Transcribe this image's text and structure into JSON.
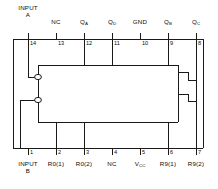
{
  "diagram": {
    "kind": "ic-pin-connection-diagram",
    "line_color": "#1a1a1a",
    "background": "#ffffff",
    "top_pins": [
      {
        "number": "14",
        "label": "INPUT",
        "label2": "A",
        "x": 28,
        "connects": true
      },
      {
        "number": "13",
        "label": "NC",
        "label2": "",
        "x": 56,
        "connects": false
      },
      {
        "number": "12",
        "label": "Q",
        "sub": "A",
        "label2": "",
        "x": 84,
        "connects": true
      },
      {
        "number": "11",
        "label": "Q",
        "sub": "D",
        "label2": "",
        "x": 112,
        "connects": true
      },
      {
        "number": "10",
        "label": "GND",
        "label2": "",
        "x": 140,
        "connects": false
      },
      {
        "number": "9",
        "label": "Q",
        "sub": "B",
        "label2": "",
        "x": 168,
        "connects": true
      },
      {
        "number": "8",
        "label": "Q",
        "sub": "C",
        "label2": "",
        "x": 196,
        "connects": true
      }
    ],
    "bottom_pins": [
      {
        "number": "1",
        "label": "INPUT",
        "label2": "B",
        "x": 28,
        "connects": true
      },
      {
        "number": "2",
        "label": "R0(1)",
        "label2": "",
        "x": 56,
        "connects": true
      },
      {
        "number": "3",
        "label": "R0(2)",
        "label2": "",
        "x": 84,
        "connects": true
      },
      {
        "number": "4",
        "label": "NC",
        "label2": "",
        "x": 112,
        "connects": false
      },
      {
        "number": "5",
        "label": "V",
        "sub": "CC",
        "label2": "",
        "x": 140,
        "connects": false
      },
      {
        "number": "6",
        "label": "R9(1)",
        "label2": "",
        "x": 168,
        "connects": true
      },
      {
        "number": "7",
        "label": "R9(2)",
        "label2": "",
        "x": 196,
        "connects": true
      }
    ],
    "outer_box": {
      "x": 13,
      "y": 39,
      "w": 190,
      "h": 109
    },
    "inner_box": {
      "x": 38,
      "y": 65,
      "w": 140,
      "h": 57
    },
    "inverter_bubbles": [
      {
        "cx": 38,
        "cy": 77,
        "r": 3.2
      },
      {
        "cx": 38,
        "cy": 100,
        "r": 3.2
      }
    ]
  }
}
